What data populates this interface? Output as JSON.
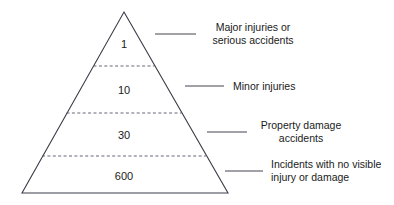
{
  "diagram": {
    "type": "safety-incident-pyramid",
    "colors": {
      "outline": "#3c3c4a",
      "divider": "#555566",
      "leader": "#444450",
      "text": "#1a1a1a",
      "background": "#ffffff"
    },
    "tiers": [
      {
        "value": "1",
        "label_lines": [
          "Major injuries or",
          "serious accidents"
        ],
        "label_align": "center"
      },
      {
        "value": "10",
        "label_lines": [
          "Minor injuries"
        ],
        "label_align": "center"
      },
      {
        "value": "30",
        "label_lines": [
          "Property damage",
          "accidents"
        ],
        "label_align": "center"
      },
      {
        "value": "600",
        "label_lines": [
          "Incidents with no visible",
          "injury or damage"
        ],
        "label_align": "left"
      }
    ]
  }
}
